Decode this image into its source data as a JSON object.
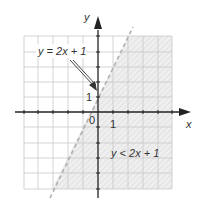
{
  "figure": {
    "type": "graph of linear inequality",
    "axes": {
      "x_label": "x",
      "y_label": "y",
      "origin_label": "0",
      "x_tick_label": "1",
      "y_tick_label": "1",
      "x_range": [
        -5,
        5
      ],
      "y_range": [
        -5,
        5
      ]
    },
    "boundary_line": {
      "equation": "y = 2x + 1",
      "style": "dashed",
      "color": "#b0b0b0"
    },
    "inequality_label": "y < 2x + 1",
    "line_label": "y = 2x + 1",
    "shaded_region": "below line (to the right)",
    "colors": {
      "grid": "#c8c8c8",
      "axis": "#222222",
      "shading": "#e8e8e8",
      "hatch": "#d0d0d0",
      "text": "#333333"
    }
  }
}
